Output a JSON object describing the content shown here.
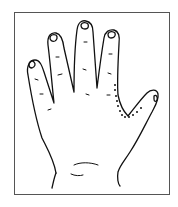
{
  "image": {
    "description": "Line drawing of the back of a left hand with dotted markings between index finger and thumb",
    "stroke_color": "#111111",
    "frame_color": "#555555",
    "background": "#ffffff"
  }
}
